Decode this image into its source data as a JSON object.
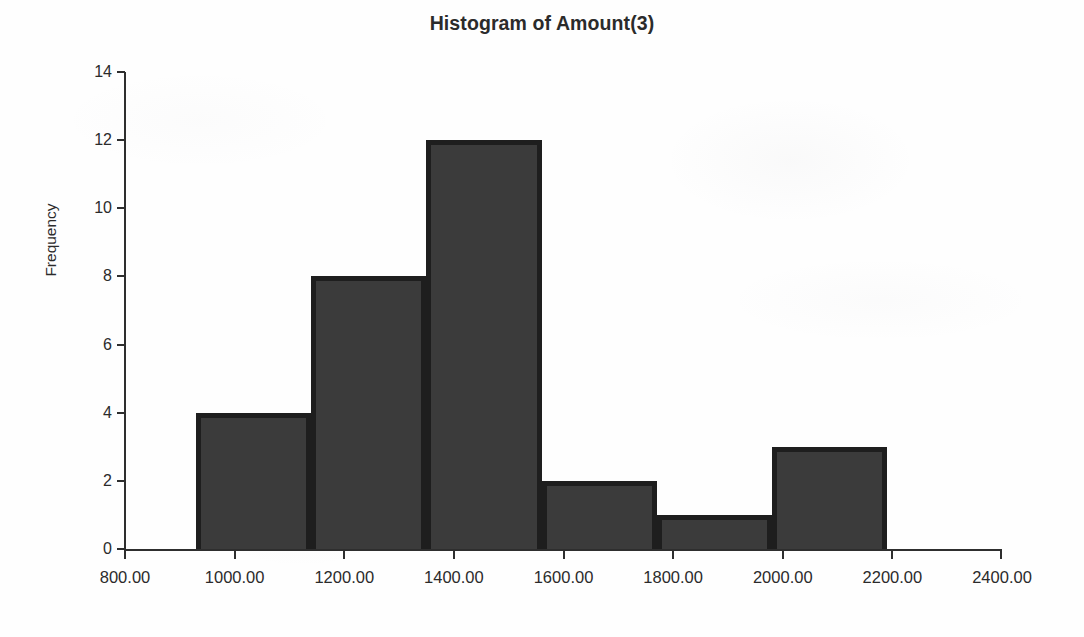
{
  "chart_data": {
    "type": "bar",
    "title": "Histogram of Amount(3)",
    "xlabel": "",
    "ylabel": "Frequency",
    "x_tick_labels": [
      "800.00",
      "1000.00",
      "1200.00",
      "1400.00",
      "1600.00",
      "1800.00",
      "2000.00",
      "2200.00",
      "2400.00"
    ],
    "x_tick_values": [
      800,
      1000,
      1200,
      1400,
      1600,
      1800,
      2000,
      2200,
      2400
    ],
    "y_tick_labels": [
      "0",
      "2",
      "4",
      "6",
      "8",
      "10",
      "12",
      "14"
    ],
    "y_tick_values": [
      0,
      2,
      4,
      6,
      8,
      10,
      12,
      14
    ],
    "xlim": [
      800,
      2400
    ],
    "ylim": [
      0,
      14
    ],
    "grid": false,
    "legend": false,
    "bin_width": 210,
    "bin_edges": [
      930,
      1140,
      1350,
      1560,
      1770,
      1980,
      2190
    ],
    "bins": [
      {
        "label": "930 - 1140",
        "start": 930,
        "end": 1140,
        "frequency": 4
      },
      {
        "label": "1140 - 1350",
        "start": 1140,
        "end": 1350,
        "frequency": 8
      },
      {
        "label": "1350 - 1560",
        "start": 1350,
        "end": 1560,
        "frequency": 12
      },
      {
        "label": "1560 - 1770",
        "start": 1560,
        "end": 1770,
        "frequency": 2
      },
      {
        "label": "1770 - 1980",
        "start": 1770,
        "end": 1980,
        "frequency": 1
      },
      {
        "label": "1980 - 2190",
        "start": 1980,
        "end": 2190,
        "frequency": 3
      }
    ],
    "values": [
      4,
      8,
      12,
      2,
      1,
      3
    ],
    "categories": [
      "930 - 1140",
      "1140 - 1350",
      "1350 - 1560",
      "1560 - 1770",
      "1770 - 1980",
      "1980 - 2190"
    ],
    "colors": {
      "bar_fill": "#3b3b3b",
      "bar_border": "#1e1e1e",
      "axis": "#2e2e2e",
      "text": "#2b2b2b",
      "background": "#fefefe"
    }
  }
}
